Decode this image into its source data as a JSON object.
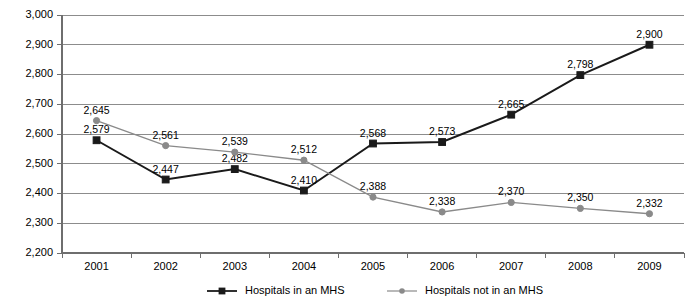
{
  "chart_data": {
    "type": "line",
    "title": "",
    "subtitle": "",
    "xlabel": "",
    "ylabel": "",
    "categories": [
      "2001",
      "2002",
      "2003",
      "2004",
      "2005",
      "2006",
      "2007",
      "2008",
      "2009"
    ],
    "ylim": [
      2200,
      3000
    ],
    "ytick_step": 100,
    "yticks": [
      "2,200",
      "2,300",
      "2,400",
      "2,500",
      "2,600",
      "2,700",
      "2,800",
      "2,900",
      "3,000"
    ],
    "grid": true,
    "legend_position": "bottom",
    "series": [
      {
        "name": "Hospitals in an MHS",
        "color": "#1a1a1a",
        "marker": "square",
        "values": [
          2579,
          2447,
          2482,
          2410,
          2568,
          2573,
          2665,
          2798,
          2900
        ],
        "labels": [
          "2,579",
          "2,447",
          "2,482",
          "2,410",
          "2,568",
          "2,573",
          "2,665",
          "2,798",
          "2,900"
        ]
      },
      {
        "name": "Hospitals not in an MHS",
        "color": "#8a8a8a",
        "marker": "circle",
        "values": [
          2645,
          2561,
          2539,
          2512,
          2388,
          2338,
          2370,
          2350,
          2332
        ],
        "labels": [
          "2,645",
          "2,561",
          "2,539",
          "2,512",
          "2,388",
          "2,338",
          "2,370",
          "2,350",
          "2,332"
        ]
      }
    ]
  },
  "legend": {
    "items": [
      {
        "label": "Hospitals in an MHS",
        "color": "#1a1a1a",
        "marker": "square"
      },
      {
        "label": "Hospitals not in an MHS",
        "color": "#8a8a8a",
        "marker": "circle"
      }
    ]
  }
}
